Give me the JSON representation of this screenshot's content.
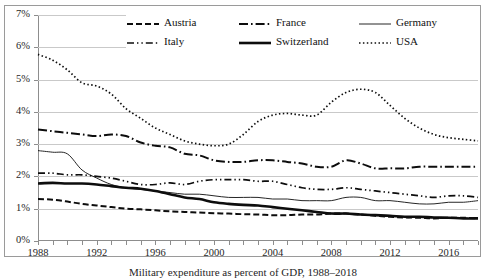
{
  "caption": "Military expenditure as percent of GDP, 1988–2018",
  "axis": {
    "y_ticks": [
      "0%",
      "1%",
      "2%",
      "3%",
      "4%",
      "5%",
      "6%",
      "7%"
    ],
    "x_ticks": [
      "1988",
      "1992",
      "1996",
      "2000",
      "2004",
      "2008",
      "2012",
      "2016"
    ]
  },
  "legend": {
    "rows": [
      [
        {
          "label": "Austria",
          "style": "dashed"
        },
        {
          "label": "France",
          "style": "dashdot"
        },
        {
          "label": "Germany",
          "style": "solid-thin"
        }
      ],
      [
        {
          "label": "Italy",
          "style": "dashdotdot"
        },
        {
          "label": "Switzerland",
          "style": "solid-thick"
        },
        {
          "label": "USA",
          "style": "dotted"
        }
      ]
    ]
  },
  "chart_data": {
    "type": "line",
    "title": "",
    "xlabel": "",
    "ylabel": "",
    "xlim": [
      1988,
      2018
    ],
    "ylim": [
      0,
      7
    ],
    "grid": true,
    "legend_position": "top",
    "x": [
      1988,
      1989,
      1990,
      1991,
      1992,
      1993,
      1994,
      1995,
      1996,
      1997,
      1998,
      1999,
      2000,
      2001,
      2002,
      2003,
      2004,
      2005,
      2006,
      2007,
      2008,
      2009,
      2010,
      2011,
      2012,
      2013,
      2014,
      2015,
      2016,
      2017,
      2018
    ],
    "series": [
      {
        "name": "USA",
        "style": "dotted",
        "values": [
          5.78,
          5.6,
          5.3,
          4.9,
          4.8,
          4.55,
          4.1,
          3.8,
          3.5,
          3.3,
          3.1,
          3.0,
          2.95,
          3.0,
          3.3,
          3.7,
          3.9,
          3.95,
          3.9,
          3.9,
          4.3,
          4.6,
          4.7,
          4.6,
          4.2,
          3.8,
          3.5,
          3.3,
          3.2,
          3.15,
          3.1
        ]
      },
      {
        "name": "France",
        "style": "dashdot",
        "values": [
          3.45,
          3.4,
          3.35,
          3.3,
          3.25,
          3.3,
          3.25,
          3.05,
          2.95,
          2.9,
          2.7,
          2.65,
          2.5,
          2.45,
          2.45,
          2.5,
          2.5,
          2.45,
          2.4,
          2.3,
          2.3,
          2.5,
          2.4,
          2.25,
          2.25,
          2.25,
          2.3,
          2.3,
          2.3,
          2.3,
          2.3
        ]
      },
      {
        "name": "Germany",
        "style": "solid-thin",
        "values": [
          2.8,
          2.75,
          2.7,
          2.2,
          1.95,
          1.75,
          1.65,
          1.6,
          1.55,
          1.5,
          1.45,
          1.45,
          1.4,
          1.35,
          1.35,
          1.35,
          1.3,
          1.3,
          1.25,
          1.25,
          1.25,
          1.35,
          1.35,
          1.25,
          1.25,
          1.2,
          1.15,
          1.15,
          1.2,
          1.2,
          1.25
        ]
      },
      {
        "name": "Italy",
        "style": "dashdotdot",
        "values": [
          2.1,
          2.1,
          2.05,
          2.05,
          2.0,
          1.95,
          1.85,
          1.75,
          1.75,
          1.8,
          1.75,
          1.85,
          1.9,
          1.9,
          1.9,
          1.85,
          1.85,
          1.75,
          1.65,
          1.6,
          1.6,
          1.65,
          1.6,
          1.55,
          1.5,
          1.45,
          1.4,
          1.35,
          1.4,
          1.4,
          1.35
        ]
      },
      {
        "name": "Switzerland",
        "style": "solid-thick",
        "values": [
          1.78,
          1.8,
          1.78,
          1.78,
          1.75,
          1.7,
          1.65,
          1.62,
          1.55,
          1.45,
          1.35,
          1.3,
          1.2,
          1.15,
          1.12,
          1.1,
          1.05,
          1.0,
          0.95,
          0.9,
          0.85,
          0.85,
          0.82,
          0.8,
          0.78,
          0.75,
          0.75,
          0.73,
          0.72,
          0.7,
          0.7
        ]
      },
      {
        "name": "Austria",
        "style": "dashed",
        "values": [
          1.3,
          1.28,
          1.22,
          1.15,
          1.1,
          1.05,
          1.0,
          0.98,
          0.95,
          0.92,
          0.9,
          0.88,
          0.86,
          0.85,
          0.83,
          0.82,
          0.8,
          0.8,
          0.82,
          0.82,
          0.85,
          0.85,
          0.82,
          0.78,
          0.75,
          0.73,
          0.72,
          0.7,
          0.72,
          0.72,
          0.7
        ]
      }
    ]
  }
}
